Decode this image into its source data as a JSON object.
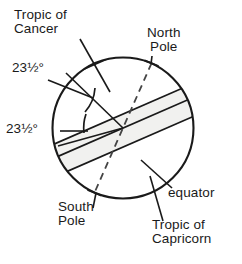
{
  "diagram": {
    "type": "geometric-diagram",
    "colors": {
      "background": "#ffffff",
      "outline": "#1a1a1a",
      "band_fill": "#f1f1ef",
      "text": "#1a1a1a",
      "leader_line": "#1a1a1a",
      "axis_dash": "#3a3a3a"
    },
    "geometry": {
      "circle": {
        "cx": 123,
        "cy": 128,
        "r": 71
      },
      "equator_tilt_degrees": 23.5,
      "axis_tilt_degrees": 23.5,
      "tropic_offset_px": 31
    },
    "labels": {
      "tropic_of_cancer": {
        "line1": "Tropic of",
        "line2": "Cancer"
      },
      "north_pole": {
        "line1": "North",
        "line2": "Pole"
      },
      "angle_upper": "23½°",
      "angle_lower": "23½°",
      "equator": "equator",
      "south_pole": {
        "line1": "South",
        "line2": "Pole"
      },
      "tropic_of_capricorn": {
        "line1": "Tropic of",
        "line2": "Capricorn"
      }
    }
  }
}
